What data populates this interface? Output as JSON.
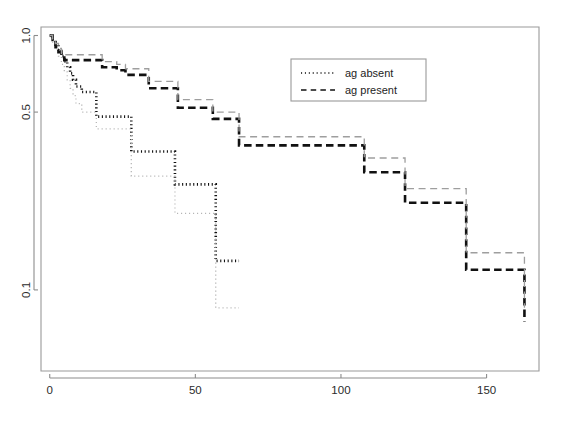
{
  "figure": {
    "width": 567,
    "height": 421,
    "background": "#ffffff"
  },
  "axes": {
    "x_ticks": [
      {
        "value": 0,
        "label": "0"
      },
      {
        "value": 50,
        "label": "50"
      },
      {
        "value": 100,
        "label": "100"
      },
      {
        "value": 150,
        "label": "150"
      }
    ],
    "y_ticks": [
      {
        "value": 1.0,
        "label": "1.0"
      },
      {
        "value": 0.5,
        "label": "0.5"
      },
      {
        "value": 0.1,
        "label": "0.1"
      }
    ],
    "x_label": "",
    "y_label": "",
    "y_scale": "log",
    "x_scale": "linear",
    "xlim": [
      -3,
      168
    ],
    "ylim": [
      0.048,
      1.08
    ],
    "grid": false,
    "frame": true
  },
  "legend": {
    "position": "top-center-right",
    "entries": [
      {
        "label": "ag absent",
        "style": "dotted",
        "color": "#111111"
      },
      {
        "label": "ag present",
        "style": "dashed",
        "color": "#111111"
      }
    ]
  },
  "chart_data": {
    "type": "line",
    "title": "",
    "subtitle": "",
    "xlabel": "",
    "ylabel": "",
    "xlim": [
      -3,
      168
    ],
    "ylim": [
      0.048,
      1.08
    ],
    "yscale": "log",
    "grid": false,
    "legend_position": "top-center-right",
    "annotations": [],
    "series": [
      {
        "name": "ag absent",
        "style": "dotted",
        "emphasis": "main",
        "interpolation": "step-after",
        "x": [
          0,
          1,
          2,
          3,
          4,
          5,
          6,
          7,
          8,
          9,
          11,
          16,
          16,
          20,
          27,
          28,
          30,
          42,
          43,
          44,
          56,
          57,
          65
        ],
        "y": [
          1.0,
          0.96,
          0.92,
          0.88,
          0.83,
          0.79,
          0.75,
          0.71,
          0.67,
          0.63,
          0.6,
          0.6,
          0.48,
          0.48,
          0.48,
          0.35,
          0.35,
          0.35,
          0.26,
          0.26,
          0.26,
          0.13,
          0.13
        ]
      },
      {
        "name": "ag absent lower band",
        "style": "dotted",
        "emphasis": "light",
        "interpolation": "step-after",
        "x": [
          0,
          1,
          2,
          3,
          4,
          5,
          6,
          7,
          8,
          9,
          11,
          16,
          16,
          20,
          27,
          28,
          30,
          42,
          43,
          44,
          56,
          57,
          65
        ],
        "y": [
          0.99,
          0.93,
          0.88,
          0.83,
          0.77,
          0.72,
          0.67,
          0.62,
          0.58,
          0.54,
          0.5,
          0.5,
          0.43,
          0.43,
          0.43,
          0.28,
          0.28,
          0.28,
          0.2,
          0.2,
          0.2,
          0.085,
          0.085
        ]
      },
      {
        "name": "ag present",
        "style": "dashed",
        "emphasis": "main",
        "interpolation": "step-after",
        "x": [
          0,
          1,
          2,
          3,
          4,
          5,
          8,
          13,
          18,
          23,
          26,
          31,
          34,
          40,
          44,
          50,
          56,
          65,
          100,
          108,
          120,
          122,
          133,
          143,
          163
        ],
        "y": [
          1.0,
          0.95,
          0.9,
          0.86,
          0.82,
          0.8,
          0.8,
          0.8,
          0.75,
          0.73,
          0.7,
          0.7,
          0.62,
          0.62,
          0.52,
          0.52,
          0.47,
          0.37,
          0.37,
          0.29,
          0.29,
          0.22,
          0.22,
          0.12,
          0.075
        ]
      },
      {
        "name": "ag present upper band",
        "style": "dashed",
        "emphasis": "light",
        "interpolation": "step-after",
        "x": [
          0,
          1,
          2,
          3,
          4,
          5,
          8,
          13,
          18,
          23,
          26,
          31,
          34,
          40,
          44,
          50,
          56,
          65,
          100,
          108,
          120,
          122,
          133,
          143,
          163
        ],
        "y": [
          1.0,
          0.97,
          0.93,
          0.89,
          0.85,
          0.84,
          0.84,
          0.84,
          0.79,
          0.77,
          0.74,
          0.74,
          0.66,
          0.66,
          0.56,
          0.56,
          0.5,
          0.4,
          0.4,
          0.33,
          0.33,
          0.25,
          0.25,
          0.14,
          0.085
        ]
      }
    ]
  }
}
